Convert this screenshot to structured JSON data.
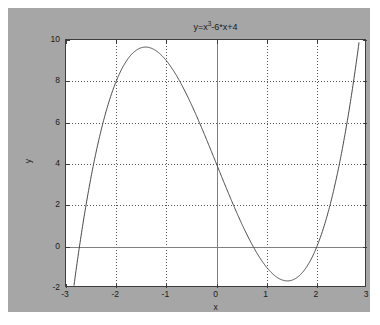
{
  "figure": {
    "background_color": "#a6a6a6",
    "axes_background_color": "#ffffff",
    "page_background_color": "#ffffff"
  },
  "chart_data": {
    "type": "line",
    "title": "y=x3-6*x+4",
    "title_base": "y=x",
    "title_exponent": "3",
    "title_tail": "-6*x+4",
    "expression": "y = x^3 - 6*x + 4",
    "xlabel": "x",
    "ylabel": "y",
    "xlim": [
      -3,
      3
    ],
    "ylim": [
      -2,
      10
    ],
    "xticks": [
      -3,
      -2,
      -1,
      0,
      1,
      2,
      3
    ],
    "xticklabels": [
      "-3",
      "-2",
      "-1",
      "0",
      "1",
      "2",
      "3"
    ],
    "yticks": [
      -2,
      0,
      2,
      4,
      6,
      8,
      10
    ],
    "yticklabels": [
      "-2",
      "0",
      "2",
      "4",
      "6",
      "8",
      "10"
    ],
    "grid": true,
    "grid_style": "dotted",
    "grid_color": "#555555",
    "zero_axis_color": "#808080",
    "legend": null,
    "line_color": "#4a4a4a",
    "line_width": 1,
    "clipped_at_ylim": true,
    "annotations": {
      "local_maximum": {
        "x": -1.414,
        "y": 9.657
      },
      "local_minimum": {
        "x": 1.414,
        "y": -1.657
      },
      "y_intercept": {
        "x": 0,
        "y": 4
      },
      "roots": [
        -2.601,
        0.7394,
        1.862
      ]
    },
    "series": [
      {
        "name": "y=x^3-6*x+4",
        "x": [
          -3.0,
          -2.9,
          -2.8,
          -2.7,
          -2.6,
          -2.5,
          -2.4,
          -2.3,
          -2.2,
          -2.1,
          -2.0,
          -1.9,
          -1.8,
          -1.7,
          -1.6,
          -1.5,
          -1.4,
          -1.3,
          -1.2,
          -1.1,
          -1.0,
          -0.9,
          -0.8,
          -0.7,
          -0.6,
          -0.5,
          -0.4,
          -0.3,
          -0.2,
          -0.1,
          0.0,
          0.1,
          0.2,
          0.3,
          0.4,
          0.5,
          0.6,
          0.7,
          0.8,
          0.9,
          1.0,
          1.1,
          1.2,
          1.3,
          1.4,
          1.5,
          1.6,
          1.7,
          1.8,
          1.9,
          2.0,
          2.1,
          2.2,
          2.3,
          2.4,
          2.5,
          2.6,
          2.7,
          2.8,
          2.9,
          3.0
        ],
        "y": [
          -5.0,
          -3.189,
          -1.352,
          0.511,
          2.424,
          4.375,
          4.576,
          5.633,
          6.552,
          7.339,
          8.0,
          8.541,
          8.968,
          9.287,
          9.504,
          9.625,
          9.656,
          9.603,
          9.472,
          9.269,
          9.0,
          8.671,
          8.288,
          7.857,
          7.384,
          6.875,
          6.336,
          5.773,
          5.192,
          4.599,
          4.0,
          3.401,
          2.808,
          2.227,
          1.664,
          1.125,
          0.616,
          0.143,
          -0.288,
          -0.671,
          -1.0,
          -1.269,
          -1.472,
          -1.603,
          -1.656,
          -1.625,
          -1.504,
          -1.287,
          -0.968,
          -0.541,
          0.0,
          0.661,
          1.448,
          2.367,
          3.424,
          4.625,
          5.976,
          7.483,
          9.152,
          10.989,
          13.0
        ]
      }
    ]
  }
}
